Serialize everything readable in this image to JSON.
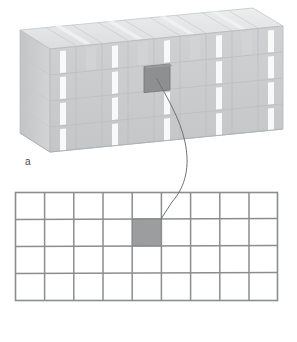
{
  "figure": {
    "width": 297,
    "height": 342,
    "background_color": "#ffffff"
  },
  "panel_a": {
    "label": "a",
    "description": "Isometric 3D block built from stacked rectangular cells with white vertical stripes on the front face",
    "columns": 9,
    "rows": 4,
    "front_face_color": "#c9cbcd",
    "top_face_color": "#e2e3e5",
    "side_face_color": "#bfc2c4",
    "stripe_color": "#f7f8f8",
    "edge_color": "#b3b6b8",
    "highlighted_cell": {
      "column": 5,
      "row": 2,
      "fill_color": "#8d8f91",
      "stroke_color": "#76787a"
    }
  },
  "panel_b": {
    "label": "b",
    "description": "Flat 2D grid representing an unfolded slice of the 3D block",
    "columns": 9,
    "rows": 4,
    "grid_line_color": "#8b8d8f",
    "cell_fill_color": "#ffffff",
    "highlighted_cell": {
      "column": 5,
      "row": 2,
      "fill_color": "#9b9d9f",
      "stroke_color": "#8b8d8f"
    }
  },
  "leader_line": {
    "description": "S-shaped curve linking the highlighted cube in panel a to the shaded cell in panel b",
    "color": "#6f7173",
    "width": 1
  },
  "colors": {
    "ink": "#4a4a4a",
    "grid": "#8b8d8f",
    "highlight": "#9b9d9f",
    "background": "#ffffff"
  }
}
